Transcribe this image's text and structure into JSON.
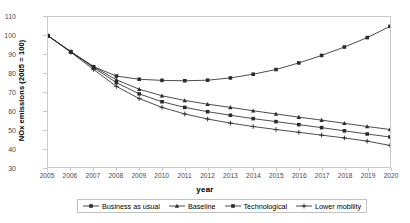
{
  "chart_data": {
    "type": "line",
    "title": "",
    "xlabel": "year",
    "ylabel": "NOx emissions (2005 = 100)",
    "xlim": [
      2005,
      2020
    ],
    "ylim": [
      30,
      110
    ],
    "yticks": [
      30,
      40,
      50,
      60,
      70,
      80,
      90,
      100,
      110
    ],
    "grid": false,
    "legend_position": "bottom",
    "x": [
      2005,
      2006,
      2007,
      2008,
      2009,
      2010,
      2011,
      2012,
      2013,
      2014,
      2015,
      2016,
      2017,
      2018,
      2019,
      2020
    ],
    "categories": [
      "2005",
      "2006",
      "2007",
      "2008",
      "2009",
      "2010",
      "2011",
      "2012",
      "2013",
      "2014",
      "2015",
      "2016",
      "2017",
      "2018",
      "2019",
      "2020"
    ],
    "series": [
      {
        "name": "Business as usual",
        "marker": "square",
        "color": "#2b2b2b",
        "values": [
          100,
          91.5,
          83.5,
          78.5,
          76.8,
          76.2,
          76.0,
          76.3,
          77.5,
          79.5,
          82.0,
          85.5,
          89.5,
          94.0,
          99.0,
          105.0
        ]
      },
      {
        "name": "Baseline",
        "marker": "triangle",
        "color": "#2b2b2b",
        "values": [
          100,
          91.5,
          83.5,
          76.5,
          71.5,
          68.0,
          65.5,
          63.5,
          61.8,
          60.0,
          58.3,
          56.6,
          55.0,
          53.3,
          51.6,
          50.0
        ]
      },
      {
        "name": "Technological",
        "marker": "square",
        "color": "#2b2b2b",
        "values": [
          100,
          91.5,
          83.0,
          75.0,
          69.0,
          64.8,
          61.8,
          59.5,
          57.6,
          55.8,
          54.2,
          52.6,
          51.0,
          49.3,
          47.6,
          46.0
        ]
      },
      {
        "name": "Lower mobility",
        "marker": "plus",
        "color": "#2b2b2b",
        "values": [
          100,
          91.2,
          82.0,
          73.0,
          66.5,
          61.8,
          58.3,
          55.6,
          53.4,
          51.6,
          50.0,
          48.5,
          47.0,
          45.5,
          43.8,
          41.5
        ]
      }
    ]
  },
  "axes": {
    "y_title": "NOx emissions (2005 = 100)",
    "x_title": "year"
  },
  "legend": {
    "entries": [
      {
        "label": "Business as usual"
      },
      {
        "label": "Baseline"
      },
      {
        "label": "Technological"
      },
      {
        "label": "Lower mobility"
      }
    ]
  },
  "colors": {
    "line": "#2b2b2b",
    "frame": "#c9c9c9",
    "tick_text": "#4a4a4a"
  }
}
